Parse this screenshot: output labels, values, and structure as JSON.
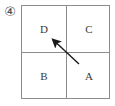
{
  "figure": {
    "item_number": "④",
    "caption": ""
  },
  "diagram": {
    "type": "quadrant-square-with-arrow",
    "quadrants": [
      {
        "position": "top-left",
        "label": "D"
      },
      {
        "position": "top-right",
        "label": "C"
      },
      {
        "position": "bottom-left",
        "label": "B"
      },
      {
        "position": "bottom-right",
        "label": "A"
      }
    ],
    "arrow": {
      "name": "direction-arrow",
      "from_quadrant": "A",
      "to_quadrant": "D",
      "direction": "up-left",
      "tail": {
        "x": 79,
        "y": 64
      },
      "tip": {
        "x": 50,
        "y": 37
      }
    },
    "colors": {
      "border": "#8c8c8c",
      "text": "#3a3a3a",
      "arrow": "#1a1a1a",
      "background": "#ffffff"
    }
  }
}
